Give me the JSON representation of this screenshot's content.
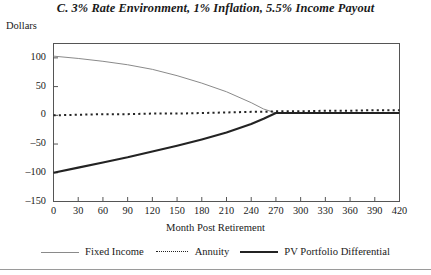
{
  "chart_data": {
    "type": "line",
    "title": "C. 3% Rate Environment, 1% Inflation, 5.5% Income Payout",
    "ylabel": "Dollars",
    "xlabel": "Month Post Retirement",
    "xlim": [
      0,
      420
    ],
    "ylim": [
      -150,
      125
    ],
    "xticks": [
      0,
      30,
      60,
      90,
      120,
      150,
      180,
      210,
      240,
      270,
      300,
      330,
      360,
      390,
      420
    ],
    "yticks": [
      100,
      50,
      0,
      -50,
      -100,
      -150
    ],
    "xtick_labels": [
      "0",
      "30",
      "60",
      "90",
      "120",
      "150",
      "180",
      "210",
      "240",
      "270",
      "300",
      "330",
      "360",
      "390",
      "420"
    ],
    "ytick_labels": [
      "100",
      "50",
      "0",
      "–50",
      "–100",
      "–150"
    ],
    "grid": false,
    "legend_position": "bottom",
    "x": [
      0,
      30,
      60,
      90,
      120,
      150,
      180,
      210,
      240,
      255,
      270,
      300,
      330,
      360,
      390,
      420
    ],
    "series": [
      {
        "name": "Fixed Income",
        "color": "#8a8a8a",
        "style": "solid-thin",
        "values": [
          103,
          99,
          94,
          88,
          80,
          69,
          56,
          41,
          22,
          11,
          4,
          4,
          4,
          4,
          4,
          4
        ]
      },
      {
        "name": "Annuity",
        "color": "#242424",
        "style": "dotted",
        "values": [
          0,
          1,
          2,
          2,
          3,
          3,
          4,
          5,
          6,
          6,
          7,
          7,
          8,
          8,
          9,
          9
        ]
      },
      {
        "name": "PV Portfolio Differential",
        "color": "#232323",
        "style": "solid-thick",
        "values": [
          -100,
          -91,
          -82,
          -73,
          -63,
          -53,
          -42,
          -30,
          -15,
          -6,
          4,
          4,
          4,
          4,
          4,
          4
        ]
      }
    ]
  },
  "legend": {
    "entries": [
      {
        "label": "Fixed Income",
        "swatch": "solid-thin-line-swatch"
      },
      {
        "label": "Annuity",
        "swatch": "dotted-line-swatch"
      },
      {
        "label": "PV Portfolio Differential",
        "swatch": "solid-thick-line-swatch"
      }
    ]
  }
}
